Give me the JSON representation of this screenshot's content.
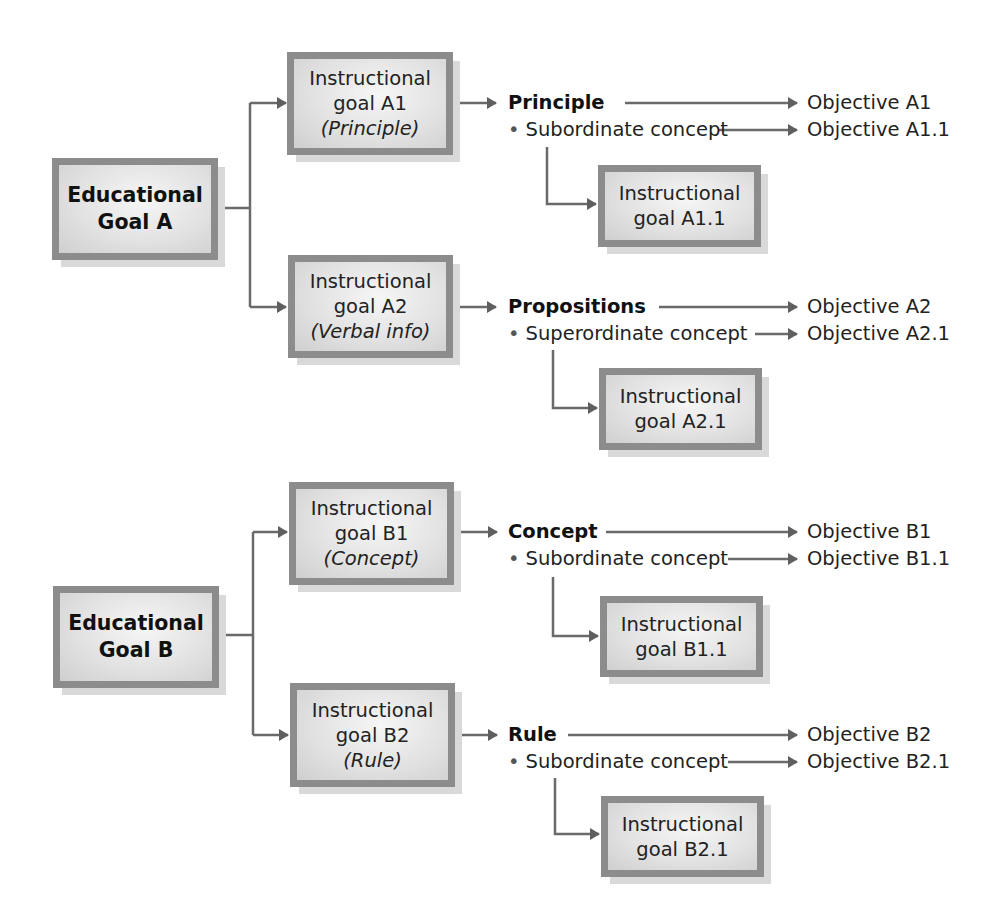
{
  "diagram": {
    "goals": [
      {
        "id": "A",
        "title_line1": "Educational",
        "title_line2": "Goal A",
        "instructional": [
          {
            "id": "A1",
            "line1": "Instructional",
            "line2": "goal A1",
            "type": "(Principle)",
            "content_label": "Principle",
            "subitem": "Subordinate concept",
            "objective": "Objective A1",
            "sub_objective": "Objective A1.1",
            "sub_goal_line1": "Instructional",
            "sub_goal_line2": "goal A1.1"
          },
          {
            "id": "A2",
            "line1": "Instructional",
            "line2": "goal A2",
            "type": "(Verbal info)",
            "content_label": "Propositions",
            "subitem": "Superordinate concept",
            "objective": "Objective A2",
            "sub_objective": "Objective A2.1",
            "sub_goal_line1": "Instructional",
            "sub_goal_line2": "goal A2.1"
          }
        ]
      },
      {
        "id": "B",
        "title_line1": "Educational",
        "title_line2": "Goal B",
        "instructional": [
          {
            "id": "B1",
            "line1": "Instructional",
            "line2": "goal B1",
            "type": "(Concept)",
            "content_label": "Concept",
            "subitem": "Subordinate concept",
            "objective": "Objective B1",
            "sub_objective": "Objective B1.1",
            "sub_goal_line1": "Instructional",
            "sub_goal_line2": "goal B1.1"
          },
          {
            "id": "B2",
            "line1": "Instructional",
            "line2": "goal B2",
            "type": "(Rule)",
            "content_label": "Rule",
            "subitem": "Subordinate concept",
            "objective": "Objective B2",
            "sub_objective": "Objective B2.1",
            "sub_goal_line1": "Instructional",
            "sub_goal_line2": "goal B2.1"
          }
        ]
      }
    ],
    "bullet_glyph": "•",
    "colors": {
      "box_border": "#8c8c8c",
      "box_fill": "#e2e2e2",
      "connector": "#666666",
      "text": "#222222"
    }
  }
}
